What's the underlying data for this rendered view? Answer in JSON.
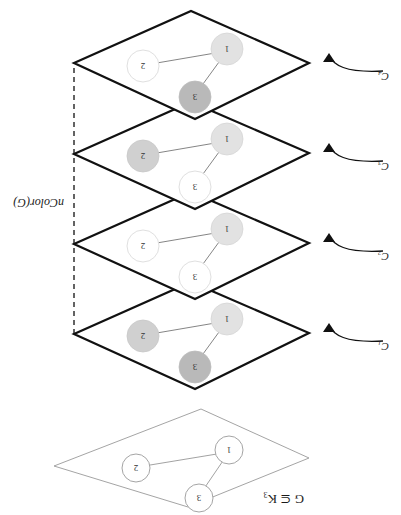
{
  "figure": {
    "title_label": "G ⊆ K₃",
    "bracket_label": "nColor(G)",
    "orientation_note": "rotated-180",
    "graph": {
      "nodes": [
        {
          "id": "1",
          "label": "1"
        },
        {
          "id": "2",
          "label": "2"
        },
        {
          "id": "3",
          "label": "3"
        }
      ],
      "edges": [
        {
          "from": "1",
          "to": "2"
        },
        {
          "from": "1",
          "to": "3"
        }
      ]
    },
    "colors": {
      "shade_light": "#e2e2e2",
      "shade_mid": "#d0d0d0",
      "shade_dark": "#b9b9b9",
      "node_empty": "#ffffff",
      "outline": "#111111",
      "thin_outline": "#9a9a9a",
      "edge": "#777777"
    },
    "top_plane": {
      "name": "G",
      "label": "G ⊆ K₃",
      "nodes": [
        {
          "label": "3",
          "fill": "none"
        },
        {
          "label": "1",
          "fill": "none"
        },
        {
          "label": "2",
          "fill": "none"
        }
      ]
    },
    "layers": [
      {
        "name": "C1",
        "label": "C₁",
        "nodes": [
          {
            "label": "3",
            "fill": "dark"
          },
          {
            "label": "1",
            "fill": "light"
          },
          {
            "label": "2",
            "fill": "mid"
          }
        ]
      },
      {
        "name": "C2",
        "label": "C₂",
        "nodes": [
          {
            "label": "3",
            "fill": "none"
          },
          {
            "label": "1",
            "fill": "light"
          },
          {
            "label": "2",
            "fill": "none"
          }
        ]
      },
      {
        "name": "C3",
        "label": "C₃",
        "nodes": [
          {
            "label": "3",
            "fill": "none"
          },
          {
            "label": "1",
            "fill": "light"
          },
          {
            "label": "2",
            "fill": "mid"
          }
        ]
      },
      {
        "name": "C4",
        "label": "C₄",
        "nodes": [
          {
            "label": "3",
            "fill": "dark"
          },
          {
            "label": "1",
            "fill": "light"
          },
          {
            "label": "2",
            "fill": "none"
          }
        ]
      }
    ]
  }
}
